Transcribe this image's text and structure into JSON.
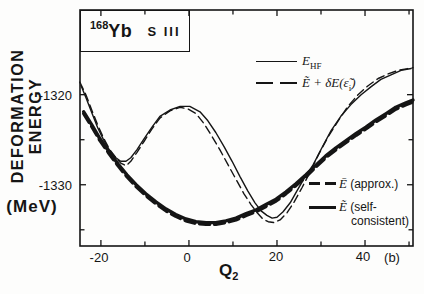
{
  "figure": {
    "title_box": {
      "mass": "168",
      "element": "Yb",
      "force": "S III"
    },
    "y_axis": {
      "title": "DEFORMATION ENERGY",
      "unit": "(MeV)",
      "tick_labels": [
        "-1320",
        "-1330"
      ]
    },
    "x_axis": {
      "title_main": "Q",
      "title_sub": "2",
      "unit": "(b)",
      "tick_labels": [
        "-20",
        "0",
        "20",
        "40"
      ]
    },
    "legend_top": {
      "row1": {
        "symbol_main": "E",
        "symbol_sub": "HF"
      },
      "row2": {
        "part1": "Ẽ + δE(ε̃",
        "sub": "i",
        "part2": ")"
      }
    },
    "legend_bottom": {
      "row1": {
        "symbol": "Ē",
        "text": "(approx.)"
      },
      "row2": {
        "symbol": "Ẽ",
        "text1": "(self-",
        "text2": "consistent)"
      }
    }
  },
  "chart_data": {
    "type": "line",
    "xlabel": "Q2 (b)",
    "ylabel": "DEFORMATION ENERGY (MeV)",
    "axes": {
      "x": {
        "range": [
          -24.75,
          50.9
        ],
        "ticks_major": [
          -20,
          0,
          20,
          40
        ],
        "ticks_minor": [
          -10,
          10,
          30,
          50
        ]
      },
      "y": {
        "range": [
          -1336.8,
          -1310.6
        ],
        "ticks_major": [
          -1320,
          -1330
        ],
        "ticks_minor": [
          -1325,
          -1335
        ]
      }
    },
    "grid": false,
    "legend_position": [
      "upper-right",
      "lower-right"
    ],
    "series": [
      {
        "id": "ehf",
        "name": "E_HF",
        "style": "thin-solid",
        "points": [
          [
            -24.5,
            -1319.0
          ],
          [
            -23.4,
            -1320.3
          ],
          [
            -22.0,
            -1322.1
          ],
          [
            -20.7,
            -1323.7
          ],
          [
            -19.3,
            -1325.1
          ],
          [
            -18.0,
            -1326.2
          ],
          [
            -16.6,
            -1327.0
          ],
          [
            -15.5,
            -1327.4
          ],
          [
            -14.3,
            -1327.4
          ],
          [
            -13.2,
            -1327.0
          ],
          [
            -11.8,
            -1326.1
          ],
          [
            -10.2,
            -1324.9
          ],
          [
            -8.4,
            -1323.6
          ],
          [
            -6.6,
            -1322.4
          ],
          [
            -4.3,
            -1321.7
          ],
          [
            -2.0,
            -1321.3
          ],
          [
            0.2,
            -1321.3
          ],
          [
            2.5,
            -1321.9
          ],
          [
            4.3,
            -1322.9
          ],
          [
            6.1,
            -1324.2
          ],
          [
            8.0,
            -1325.8
          ],
          [
            9.8,
            -1327.4
          ],
          [
            11.6,
            -1329.1
          ],
          [
            13.4,
            -1330.7
          ],
          [
            15.0,
            -1332.0
          ],
          [
            16.4,
            -1332.9
          ],
          [
            17.7,
            -1333.4
          ],
          [
            18.9,
            -1333.7
          ],
          [
            20.0,
            -1333.6
          ],
          [
            21.4,
            -1333.0
          ],
          [
            23.0,
            -1332.0
          ],
          [
            24.5,
            -1330.7
          ],
          [
            26.4,
            -1329.1
          ],
          [
            28.2,
            -1327.8
          ],
          [
            30.2,
            -1325.9
          ],
          [
            32.3,
            -1324.0
          ],
          [
            34.5,
            -1322.4
          ],
          [
            36.8,
            -1321.1
          ],
          [
            39.1,
            -1320.0
          ],
          [
            41.4,
            -1319.1
          ],
          [
            43.6,
            -1318.3
          ],
          [
            45.9,
            -1317.8
          ],
          [
            48.2,
            -1317.3
          ],
          [
            50.5,
            -1317.1
          ]
        ]
      },
      {
        "id": "etilde-plus-deltae",
        "name": "Ẽ + δE(ε̃i)",
        "style": "thin-dashed",
        "points": [
          [
            -24.8,
            -1318.6
          ],
          [
            -23.4,
            -1320.0
          ],
          [
            -22.0,
            -1321.8
          ],
          [
            -20.7,
            -1323.4
          ],
          [
            -19.3,
            -1324.9
          ],
          [
            -18.0,
            -1326.1
          ],
          [
            -16.6,
            -1327.0
          ],
          [
            -15.5,
            -1327.6
          ],
          [
            -14.3,
            -1327.9
          ],
          [
            -13.2,
            -1327.4
          ],
          [
            -11.8,
            -1326.4
          ],
          [
            -10.2,
            -1325.2
          ],
          [
            -8.4,
            -1323.8
          ],
          [
            -6.6,
            -1322.6
          ],
          [
            -4.3,
            -1321.8
          ],
          [
            -2.0,
            -1321.4
          ],
          [
            -0.2,
            -1321.6
          ],
          [
            1.6,
            -1322.1
          ],
          [
            3.4,
            -1323.2
          ],
          [
            5.2,
            -1324.6
          ],
          [
            7.0,
            -1326.1
          ],
          [
            8.9,
            -1327.8
          ],
          [
            10.7,
            -1329.4
          ],
          [
            12.5,
            -1331.0
          ],
          [
            14.1,
            -1332.2
          ],
          [
            15.5,
            -1333.1
          ],
          [
            16.8,
            -1333.8
          ],
          [
            18.0,
            -1334.1
          ],
          [
            19.3,
            -1334.2
          ],
          [
            20.7,
            -1333.9
          ],
          [
            22.3,
            -1333.1
          ],
          [
            23.9,
            -1331.9
          ],
          [
            25.7,
            -1330.3
          ],
          [
            27.5,
            -1328.6
          ],
          [
            29.5,
            -1326.6
          ],
          [
            31.6,
            -1324.7
          ],
          [
            33.9,
            -1322.9
          ],
          [
            36.1,
            -1321.3
          ],
          [
            38.4,
            -1320.0
          ],
          [
            40.7,
            -1319.0
          ],
          [
            43.0,
            -1318.2
          ],
          [
            45.2,
            -1317.7
          ],
          [
            47.5,
            -1317.3
          ],
          [
            49.8,
            -1317.1
          ],
          [
            50.9,
            -1317.0
          ]
        ]
      },
      {
        "id": "ebar-approx",
        "name": "Ē (approx.)",
        "style": "thick-dashed",
        "points": [
          [
            -23.9,
            -1322.1
          ],
          [
            -22.0,
            -1323.6
          ],
          [
            -20.2,
            -1325.1
          ],
          [
            -18.2,
            -1326.5
          ],
          [
            -16.1,
            -1327.9
          ],
          [
            -14.1,
            -1329.1
          ],
          [
            -12.0,
            -1330.2
          ],
          [
            -9.8,
            -1331.2
          ],
          [
            -7.5,
            -1332.1
          ],
          [
            -5.2,
            -1332.9
          ],
          [
            -3.0,
            -1333.5
          ],
          [
            -0.7,
            -1334.0
          ],
          [
            1.6,
            -1334.3
          ],
          [
            3.9,
            -1334.4
          ],
          [
            6.1,
            -1334.4
          ],
          [
            8.4,
            -1334.2
          ],
          [
            10.7,
            -1333.9
          ],
          [
            13.0,
            -1333.4
          ],
          [
            15.2,
            -1333.0
          ],
          [
            17.5,
            -1332.4
          ],
          [
            19.8,
            -1331.8
          ],
          [
            22.0,
            -1331.0
          ],
          [
            24.3,
            -1330.1
          ],
          [
            26.6,
            -1329.1
          ],
          [
            28.9,
            -1328.0
          ],
          [
            31.1,
            -1327.0
          ],
          [
            33.4,
            -1326.1
          ],
          [
            35.7,
            -1325.3
          ],
          [
            38.0,
            -1324.5
          ],
          [
            40.2,
            -1323.8
          ],
          [
            42.5,
            -1323.0
          ],
          [
            44.8,
            -1322.3
          ],
          [
            47.0,
            -1321.6
          ],
          [
            49.3,
            -1321.1
          ],
          [
            50.9,
            -1320.8
          ]
        ]
      },
      {
        "id": "etilde-selfconsistent",
        "name": "Ẽ (self-consistent)",
        "style": "thick-solid",
        "points": [
          [
            -23.9,
            -1321.9
          ],
          [
            -22.0,
            -1323.4
          ],
          [
            -20.2,
            -1324.9
          ],
          [
            -18.2,
            -1326.3
          ],
          [
            -16.1,
            -1327.7
          ],
          [
            -14.1,
            -1328.9
          ],
          [
            -12.0,
            -1330.0
          ],
          [
            -9.8,
            -1331.0
          ],
          [
            -7.5,
            -1331.9
          ],
          [
            -5.2,
            -1332.7
          ],
          [
            -3.0,
            -1333.3
          ],
          [
            -0.7,
            -1333.8
          ],
          [
            1.6,
            -1334.1
          ],
          [
            3.9,
            -1334.2
          ],
          [
            6.1,
            -1334.2
          ],
          [
            8.4,
            -1334.0
          ],
          [
            10.7,
            -1333.7
          ],
          [
            13.0,
            -1333.2
          ],
          [
            15.2,
            -1332.8
          ],
          [
            17.5,
            -1332.2
          ],
          [
            19.8,
            -1331.6
          ],
          [
            22.0,
            -1330.8
          ],
          [
            24.3,
            -1329.9
          ],
          [
            26.6,
            -1328.9
          ],
          [
            28.9,
            -1327.8
          ],
          [
            31.1,
            -1326.8
          ],
          [
            33.4,
            -1325.9
          ],
          [
            35.7,
            -1325.1
          ],
          [
            38.0,
            -1324.3
          ],
          [
            40.2,
            -1323.6
          ],
          [
            42.5,
            -1322.8
          ],
          [
            44.8,
            -1322.1
          ],
          [
            47.0,
            -1321.4
          ],
          [
            49.3,
            -1320.9
          ],
          [
            50.9,
            -1320.6
          ]
        ]
      }
    ]
  }
}
